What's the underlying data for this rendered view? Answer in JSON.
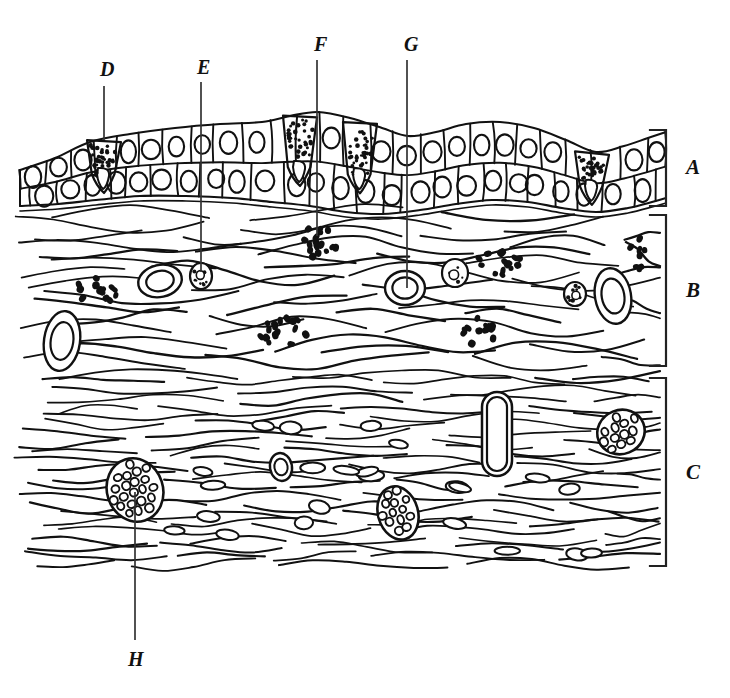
{
  "figure": {
    "kind": "histology-cross-section",
    "title_visible": false,
    "background_color": "#ffffff",
    "ink_color": "#111111",
    "width": 730,
    "height": 698
  },
  "layer_brackets": [
    {
      "id": "A",
      "label": "A",
      "name": "epithelium-layer",
      "label_x": 686,
      "label_y": 169,
      "bracket_x": 666,
      "bracket_top": 130,
      "bracket_bottom": 206,
      "tick": 16
    },
    {
      "id": "B",
      "label": "B",
      "name": "lamina-propria-layer",
      "label_x": 686,
      "label_y": 292,
      "bracket_x": 666,
      "bracket_top": 215,
      "bracket_bottom": 366,
      "tick": 16
    },
    {
      "id": "C",
      "label": "C",
      "name": "submucosa-layer",
      "label_x": 686,
      "label_y": 474,
      "bracket_x": 666,
      "bracket_top": 378,
      "bracket_bottom": 566,
      "tick": 16
    }
  ],
  "leader_labels": [
    {
      "id": "D",
      "label": "D",
      "name": "goblet-cell-callout",
      "label_x": 100,
      "label_y": 72,
      "line_x": 104,
      "line_y1": 86,
      "line_y2": 140
    },
    {
      "id": "E",
      "label": "E",
      "name": "fibroblast-callout",
      "label_x": 197,
      "label_y": 70,
      "line_x": 201,
      "line_y1": 82,
      "line_y2": 272
    },
    {
      "id": "F",
      "label": "F",
      "name": "mast-cell-cluster-callout",
      "label_x": 314,
      "label_y": 47,
      "line_x": 317,
      "line_y1": 60,
      "line_y2": 236
    },
    {
      "id": "G",
      "label": "G",
      "name": "blood-vessel-callout",
      "label_x": 404,
      "label_y": 47,
      "line_x": 407,
      "line_y1": 60,
      "line_y2": 288
    },
    {
      "id": "H",
      "label": "H",
      "name": "nerve-bundle-callout",
      "label_x": 128,
      "label_y": 662,
      "line_x": 135,
      "line_y1": 492,
      "line_y2": 640
    }
  ],
  "chart_data": {
    "type": "diagram",
    "title": "",
    "regions": [
      {
        "key": "A",
        "y_top": 108,
        "y_bottom": 208,
        "content": "epithelium"
      },
      {
        "key": "B",
        "y_top": 208,
        "y_bottom": 372,
        "content": "loose-connective-tissue"
      },
      {
        "key": "C",
        "y_top": 372,
        "y_bottom": 566,
        "content": "dense-connective-tissue"
      }
    ],
    "epithelium": {
      "top_profile": [
        [
          20,
          170
        ],
        [
          55,
          158
        ],
        [
          90,
          142
        ],
        [
          130,
          134
        ],
        [
          175,
          128
        ],
        [
          220,
          124
        ],
        [
          262,
          122
        ],
        [
          290,
          116
        ],
        [
          318,
          112
        ],
        [
          350,
          118
        ],
        [
          382,
          128
        ],
        [
          408,
          136
        ],
        [
          436,
          132
        ],
        [
          466,
          124
        ],
        [
          500,
          122
        ],
        [
          534,
          128
        ],
        [
          566,
          140
        ],
        [
          596,
          152
        ],
        [
          624,
          146
        ],
        [
          648,
          138
        ],
        [
          666,
          132
        ]
      ],
      "basement_profile": [
        [
          20,
          206
        ],
        [
          58,
          204
        ],
        [
          96,
          200
        ],
        [
          140,
          196
        ],
        [
          186,
          196
        ],
        [
          232,
          198
        ],
        [
          272,
          202
        ],
        [
          310,
          206
        ],
        [
          346,
          212
        ],
        [
          382,
          214
        ],
        [
          420,
          210
        ],
        [
          456,
          204
        ],
        [
          492,
          200
        ],
        [
          528,
          202
        ],
        [
          562,
          208
        ],
        [
          596,
          212
        ],
        [
          628,
          208
        ],
        [
          652,
          202
        ],
        [
          666,
          198
        ]
      ],
      "goblet_cells_x": [
        104,
        300,
        360,
        592
      ],
      "cell_columns": 24
    },
    "loose_tissue": {
      "fiber_rows": 16,
      "mast_cell_clusters": [
        {
          "cx": 96,
          "cy": 290,
          "rx": 22,
          "ry": 14,
          "n": 13
        },
        {
          "cx": 317,
          "cy": 243,
          "rx": 20,
          "ry": 18,
          "n": 17
        },
        {
          "cx": 281,
          "cy": 330,
          "rx": 26,
          "ry": 16,
          "n": 16
        },
        {
          "cx": 499,
          "cy": 262,
          "rx": 22,
          "ry": 14,
          "n": 15
        },
        {
          "cx": 478,
          "cy": 331,
          "rx": 18,
          "ry": 14,
          "n": 13
        },
        {
          "cx": 637,
          "cy": 252,
          "rx": 8,
          "ry": 18,
          "n": 8
        }
      ],
      "vessels": [
        {
          "cx": 160,
          "cy": 281,
          "rx": 22,
          "ry": 16,
          "rot": -12
        },
        {
          "cx": 405,
          "cy": 288,
          "rx": 20,
          "ry": 17,
          "rot": 0
        },
        {
          "cx": 62,
          "cy": 341,
          "rx": 18,
          "ry": 30,
          "rot": 8
        },
        {
          "cx": 613,
          "cy": 296,
          "rx": 18,
          "ry": 28,
          "rot": -10
        }
      ],
      "stippled_cells": [
        {
          "cx": 201,
          "cy": 276,
          "rx": 11,
          "ry": 13
        },
        {
          "cx": 455,
          "cy": 273,
          "rx": 13,
          "ry": 14
        },
        {
          "cx": 575,
          "cy": 294,
          "rx": 11,
          "ry": 12
        }
      ]
    },
    "dense_tissue": {
      "fiber_rows": 22,
      "nerve_bundles": [
        {
          "cx": 135,
          "cy": 490,
          "rx": 28,
          "ry": 32,
          "rot": -18,
          "n": 19
        },
        {
          "cx": 398,
          "cy": 513,
          "rx": 20,
          "ry": 27,
          "rot": -16,
          "n": 15
        },
        {
          "cx": 621,
          "cy": 432,
          "rx": 24,
          "ry": 22,
          "rot": -22,
          "n": 16
        }
      ],
      "vessels": [
        {
          "cx": 497,
          "cy": 434,
          "rx": 15,
          "ry": 42,
          "rot": 0
        },
        {
          "cx": 281,
          "cy": 467,
          "rx": 11,
          "ry": 14,
          "rot": -10
        }
      ],
      "nuclei_count": 34
    }
  }
}
